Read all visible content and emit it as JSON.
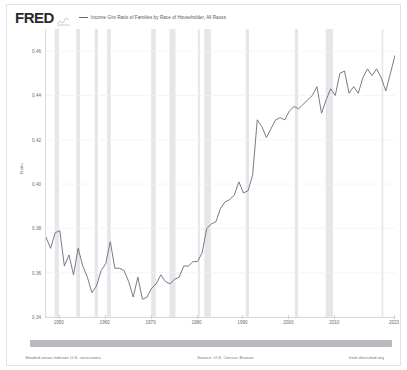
{
  "header": {
    "logo_text": "FRED",
    "logo_icon": "sparkline-icon",
    "legend": [
      {
        "label": "Income Gini Ratio of Families by Race of Householder, All Races",
        "color": "#6b6b7a"
      }
    ]
  },
  "footer": {
    "recession_note": "Shaded areas indicate U.S. recessions.",
    "source": "Source: U.S. Census Bureau",
    "site": "fred.stlouisfed.org"
  },
  "chart_data": {
    "type": "line",
    "title": "Income Gini Ratio of Families by Race of Householder, All Races",
    "xlabel": "",
    "ylabel": "Ratio",
    "ylim": [
      0.34,
      0.47
    ],
    "xlim": [
      1947,
      2023
    ],
    "grid": true,
    "legend_position": "top",
    "line_color": "#6b6b7a",
    "recession_color": "#e6e6ea",
    "yticks": [
      0.46,
      0.44,
      0.42,
      0.4,
      0.38,
      0.36,
      0.34
    ],
    "ytick_labels": [
      "0.46",
      "0.44",
      "0.42",
      "0.40",
      "0.38",
      "0.36",
      "0.34"
    ],
    "xticks": [
      1950,
      1960,
      1970,
      1980,
      1990,
      2000,
      2010,
      2023
    ],
    "xtick_labels": [
      "1950",
      "1960",
      "1970",
      "1980",
      "1990",
      "2000",
      "2010",
      "2023"
    ],
    "recessions": [
      {
        "start": 1948.9,
        "end": 1949.8
      },
      {
        "start": 1953.6,
        "end": 1954.4
      },
      {
        "start": 1957.6,
        "end": 1958.3
      },
      {
        "start": 1960.3,
        "end": 1961.1
      },
      {
        "start": 1969.9,
        "end": 1970.9
      },
      {
        "start": 1973.9,
        "end": 1975.2
      },
      {
        "start": 1980.1,
        "end": 1980.5
      },
      {
        "start": 1981.5,
        "end": 1982.9
      },
      {
        "start": 1990.5,
        "end": 1991.2
      },
      {
        "start": 2001.2,
        "end": 2001.9
      },
      {
        "start": 2007.9,
        "end": 2009.5
      },
      {
        "start": 2020.1,
        "end": 2020.4
      }
    ],
    "x": [
      1947,
      1948,
      1949,
      1950,
      1951,
      1952,
      1953,
      1954,
      1955,
      1956,
      1957,
      1958,
      1959,
      1960,
      1961,
      1962,
      1963,
      1964,
      1965,
      1966,
      1967,
      1968,
      1969,
      1970,
      1971,
      1972,
      1973,
      1974,
      1975,
      1976,
      1977,
      1978,
      1979,
      1980,
      1981,
      1982,
      1983,
      1984,
      1985,
      1986,
      1987,
      1988,
      1989,
      1990,
      1991,
      1992,
      1993,
      1994,
      1995,
      1996,
      1997,
      1998,
      1999,
      2000,
      2001,
      2002,
      2003,
      2004,
      2005,
      2006,
      2007,
      2008,
      2009,
      2010,
      2011,
      2012,
      2013,
      2014,
      2015,
      2016,
      2017,
      2018,
      2019,
      2020,
      2021,
      2022,
      2023
    ],
    "values": [
      0.376,
      0.371,
      0.378,
      0.379,
      0.363,
      0.368,
      0.359,
      0.371,
      0.363,
      0.358,
      0.351,
      0.354,
      0.361,
      0.364,
      0.374,
      0.362,
      0.362,
      0.361,
      0.356,
      0.349,
      0.358,
      0.348,
      0.349,
      0.353,
      0.355,
      0.359,
      0.356,
      0.355,
      0.357,
      0.358,
      0.363,
      0.363,
      0.365,
      0.365,
      0.369,
      0.38,
      0.382,
      0.383,
      0.389,
      0.392,
      0.393,
      0.395,
      0.401,
      0.396,
      0.397,
      0.404,
      0.429,
      0.426,
      0.421,
      0.425,
      0.429,
      0.43,
      0.429,
      0.433,
      0.435,
      0.434,
      0.436,
      0.438,
      0.44,
      0.444,
      0.432,
      0.438,
      0.443,
      0.44,
      0.45,
      0.451,
      0.441,
      0.444,
      0.441,
      0.448,
      0.452,
      0.449,
      0.452,
      0.448,
      0.442,
      0.45,
      0.458
    ]
  }
}
